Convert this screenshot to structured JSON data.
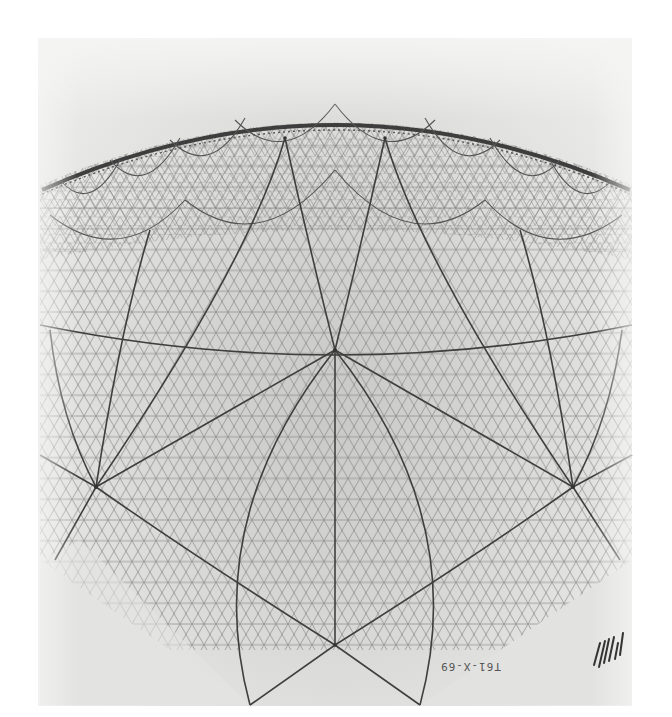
{
  "artwork": {
    "subject": "Geodesic dome drawing",
    "medium": "pencil on paper",
    "colors": {
      "background": "#ffffff",
      "paper": "#d8d8d6",
      "line": "#4a4a4a",
      "fine_line": "#7a7a7a"
    },
    "inscription": "T61-X-69",
    "signature_mark": "hatched monogram"
  }
}
